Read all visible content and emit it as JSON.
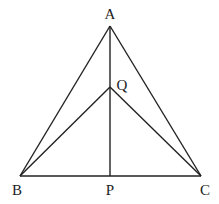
{
  "diagram": {
    "type": "geometry",
    "points": {
      "A": {
        "label": "A",
        "x": 110,
        "y": 26,
        "lx": 110,
        "ly": 19
      },
      "Q": {
        "label": "Q",
        "x": 110,
        "y": 87,
        "lx": 122,
        "ly": 90
      },
      "B": {
        "label": "B",
        "x": 20,
        "y": 176,
        "lx": 17,
        "ly": 195
      },
      "P": {
        "label": "P",
        "x": 110,
        "y": 176,
        "lx": 110,
        "ly": 195
      },
      "C": {
        "label": "C",
        "x": 201,
        "y": 176,
        "lx": 205,
        "ly": 195
      }
    },
    "segments": [
      [
        "A",
        "B"
      ],
      [
        "A",
        "C"
      ],
      [
        "B",
        "C"
      ],
      [
        "A",
        "P"
      ],
      [
        "Q",
        "B"
      ],
      [
        "Q",
        "C"
      ]
    ],
    "line_color": "#222222"
  }
}
